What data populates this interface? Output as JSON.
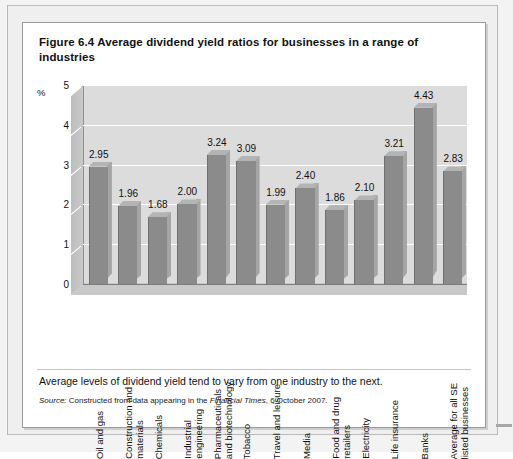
{
  "figure": {
    "title": "Figure 6.4  Average dividend yield ratios for businesses in a range of industries",
    "caption": "Average levels of dividend yield tend to vary from one industry to the next.",
    "source_prefix": "Source:",
    "source_text_before": " Constructed from data appearing in the ",
    "source_italic": "Financial Times",
    "source_text_after": ", 6 October 2007."
  },
  "chart_data": {
    "type": "bar",
    "title": "Average dividend yield ratios for businesses in a range of industries",
    "xlabel": "",
    "ylabel": "%",
    "ylim": [
      0,
      5
    ],
    "yticks": [
      0,
      1,
      2,
      3,
      4,
      5
    ],
    "ytick_labels": [
      "0",
      "1",
      "2",
      "3",
      "4",
      "5"
    ],
    "grid": true,
    "legend": false,
    "bar_color": "#8b8b8b",
    "panel_color": "#dcdcdc",
    "gridline_color": "#ffffff",
    "categories": [
      "Oil and gas",
      "Construction and materials",
      "Chemicals",
      "Industrial engineering",
      "Pharmaceuticals and biotechnology",
      "Tobacco",
      "Travel and leisure",
      "Media",
      "Food and drug retailers",
      "Electricity",
      "Life insurance",
      "Banks",
      "Average for all SE listed businesses"
    ],
    "values": [
      2.95,
      1.96,
      1.68,
      2.0,
      3.24,
      3.09,
      1.99,
      2.4,
      1.86,
      2.1,
      3.21,
      4.43,
      2.83
    ],
    "value_labels": [
      "2.95",
      "1.96",
      "1.68",
      "2.00",
      "3.24",
      "3.09",
      "1.99",
      "2.40",
      "1.86",
      "2.10",
      "3.21",
      "4.43",
      "2.83"
    ]
  }
}
